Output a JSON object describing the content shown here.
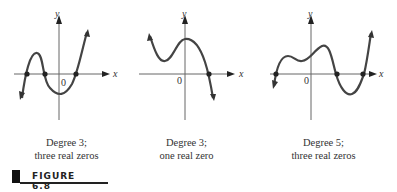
{
  "graphs": [
    {
      "axis_x": "x",
      "axis_y": "y",
      "origin": "0",
      "degree_label": "Degree 3;",
      "zeros_label": "three real zeros"
    },
    {
      "axis_x": "x",
      "axis_y": "y",
      "origin": "0",
      "degree_label": "Degree 3;",
      "zeros_label": "one real zero"
    },
    {
      "axis_x": "x",
      "axis_y": "y",
      "origin": "0",
      "degree_label": "Degree 5;",
      "zeros_label": "three real zeros"
    }
  ],
  "figure": {
    "label": "FIGURE 6.8"
  },
  "colors": {
    "curve": "#444444",
    "axis": "#555555"
  }
}
